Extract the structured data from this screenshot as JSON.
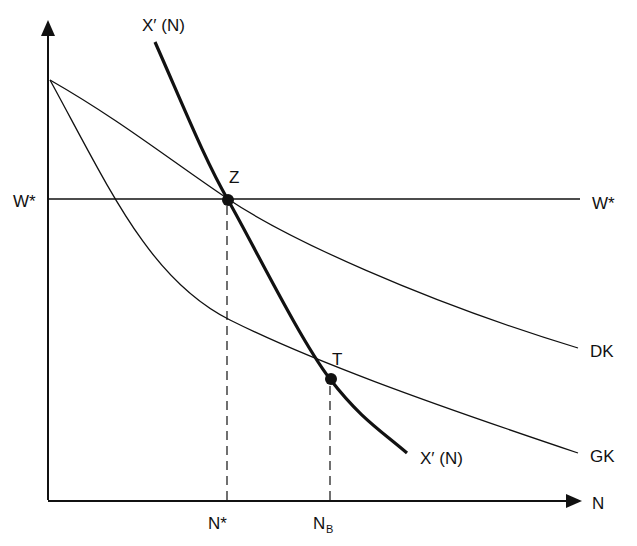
{
  "diagram": {
    "type": "economics-curve-diagram",
    "colors": {
      "ink": "#111111",
      "background": "#ffffff"
    },
    "axes": {
      "y_axis": {
        "arrow": true,
        "label": ""
      },
      "x_axis": {
        "arrow": true,
        "label": "N"
      }
    },
    "curves": {
      "x_prime_top_label": "X′ (N)",
      "x_prime_bottom_label": "X′ (N)",
      "dk_label": "DK",
      "gk_label": "GK",
      "w_star_right_label": "W*"
    },
    "y_ticks": {
      "w_star": "W*"
    },
    "x_ticks": {
      "n_star": "N*",
      "n_b_main": "N",
      "n_b_sub": "B"
    },
    "points": {
      "z": "Z",
      "t": "T"
    }
  }
}
